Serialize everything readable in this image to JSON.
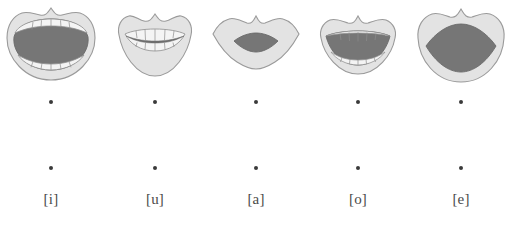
{
  "figure": {
    "name": "vowel-mouth-shapes-diagram",
    "background_color": "#ffffff",
    "colors": {
      "lip_fill": "#e3e3e3",
      "lip_stroke": "#9a9a9a",
      "cavity_fill": "#767676",
      "cavity_stroke": "#6a6a6a",
      "teeth_fill": "#f4f4f4",
      "teeth_stroke": "#8d8d8d",
      "dot_color": "#3a3a3a",
      "label_color": "#4a4a4a"
    },
    "items": [
      {
        "id": "vowel-i",
        "label": "[i]",
        "mouth_name": "mouth-shape-i",
        "description": "wide open mouth, upper and lower teeth visible, large dark oral cavity",
        "x": 0
      },
      {
        "id": "vowel-u",
        "label": "[u]",
        "mouth_name": "mouth-shape-u",
        "description": "rounded protruded lips, upper and lower teeth rows with narrow dark slit",
        "x": 104
      },
      {
        "id": "vowel-a",
        "label": "[a]",
        "mouth_name": "mouth-shape-a",
        "description": "closed wide lips with small lens-shaped dark opening, no teeth visible",
        "x": 205
      },
      {
        "id": "vowel-o",
        "label": "[o]",
        "mouth_name": "mouth-shape-o",
        "description": "half open mouth, dark cavity with teeth outlines at top and bottom",
        "x": 307
      },
      {
        "id": "vowel-e",
        "label": "[e]",
        "mouth_name": "mouth-shape-e",
        "description": "rounded open mouth with large almond-shaped dark cavity, no teeth",
        "x": 410
      }
    ]
  }
}
